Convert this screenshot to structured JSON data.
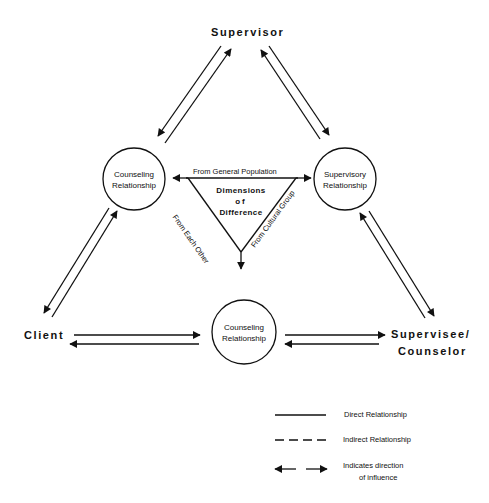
{
  "nodes": {
    "supervisor": "Supervisor",
    "client": "Client",
    "supervisee_line1": "Supervisee/",
    "supervisee_line2": "Counselor"
  },
  "circles": {
    "left": {
      "line1": "Counseling",
      "line2": "Relationship"
    },
    "right": {
      "line1": "Supervisory",
      "line2": "Relationship"
    },
    "bottom": {
      "line1": "Counseling",
      "line2": "Relationship"
    }
  },
  "triangle": {
    "title_line1": "Dimensions",
    "title_line2": "of",
    "title_line3": "Difference",
    "top_edge": "From General Population",
    "left_edge": "From Each Other",
    "right_edge": "From Cultural Group"
  },
  "legend": {
    "direct": "Direct Relationship",
    "indirect": "Indirect Relationship",
    "direction_line1": "Indicates direction",
    "direction_line2": "of influence"
  },
  "colors": {
    "line": "#111111",
    "background": "#ffffff"
  }
}
